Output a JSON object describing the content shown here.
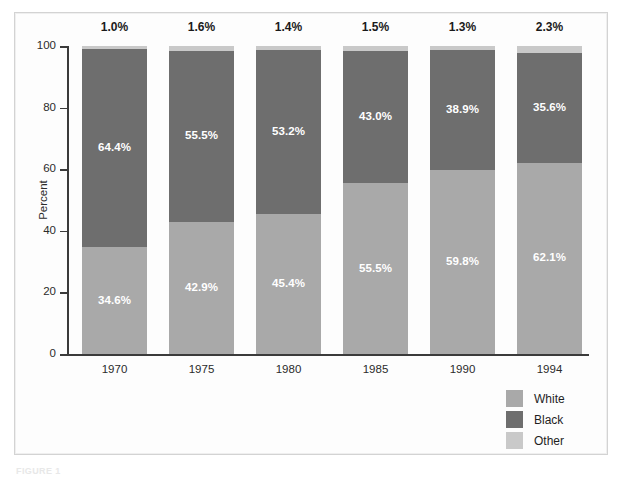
{
  "chart_data": {
    "type": "bar",
    "subtype": "stacked-bar-100-percent",
    "title": "",
    "xlabel": "",
    "ylabel": "Percent",
    "ylim": [
      0,
      100
    ],
    "yticks": [
      0,
      20,
      40,
      60,
      80,
      100
    ],
    "ytick_labels": [
      "0",
      "20",
      "40",
      "60",
      "80",
      "100"
    ],
    "grid": false,
    "legend_position": "bottom-right",
    "categories": [
      "1970",
      "1975",
      "1980",
      "1985",
      "1990",
      "1994"
    ],
    "series": [
      {
        "name": "White",
        "color": "#a9a9a9",
        "stack_order": 0,
        "values": [
          34.6,
          42.9,
          45.4,
          55.5,
          59.8,
          62.1
        ],
        "labels": [
          "34.6%",
          "42.9%",
          "45.4%",
          "55.5%",
          "59.8%",
          "62.1%"
        ],
        "label_placement": "inside"
      },
      {
        "name": "Black",
        "color": "#6e6e6e",
        "stack_order": 1,
        "values": [
          64.4,
          55.5,
          53.2,
          43.0,
          38.9,
          35.6
        ],
        "labels": [
          "64.4%",
          "55.5%",
          "53.2%",
          "43.0%",
          "38.9%",
          "35.6%"
        ],
        "label_placement": "inside"
      },
      {
        "name": "Other",
        "color": "#c9c9c9",
        "stack_order": 2,
        "values": [
          1.0,
          1.6,
          1.4,
          1.5,
          1.3,
          2.3
        ],
        "labels": [
          "1.0%",
          "1.6%",
          "1.4%",
          "1.5%",
          "1.3%",
          "2.3%"
        ],
        "label_placement": "above-bar"
      }
    ]
  },
  "axis": {
    "y_title": "Percent",
    "y_ticks": [
      "100",
      "80",
      "60",
      "40",
      "20",
      "0"
    ]
  },
  "legend": {
    "items": [
      {
        "label": "White",
        "color": "#a9a9a9"
      },
      {
        "label": "Black",
        "color": "#6e6e6e"
      },
      {
        "label": "Other",
        "color": "#c9c9c9"
      }
    ]
  },
  "caption": {
    "text": "FIGURE 1"
  },
  "colors": {
    "white_series": "#a9a9a9",
    "black_series": "#6e6e6e",
    "other_series": "#c9c9c9",
    "axis": "#3b3b3b",
    "frame": "#d3d3d3",
    "background": "#fdfdfd",
    "inside_label": "#ffffff",
    "top_label": "#1a1a1a"
  }
}
